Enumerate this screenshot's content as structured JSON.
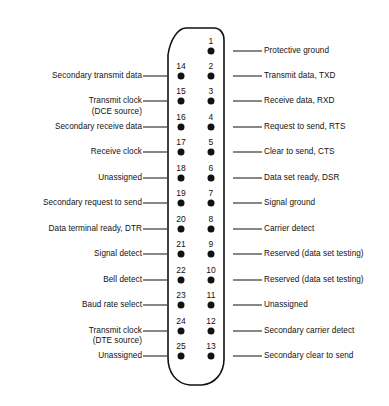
{
  "diagram": {
    "type": "db25-serial-connector-pinout",
    "connector": {
      "shape": "d-subminiature-db25",
      "outline_color": "#111111",
      "pin_color": "#111111",
      "background": "#ffffff"
    },
    "right_column": {
      "side": "right",
      "pins": [
        {
          "number": "1",
          "label": "Protective ground"
        },
        {
          "number": "2",
          "label": "Transmit data, TXD"
        },
        {
          "number": "3",
          "label": "Receive data, RXD"
        },
        {
          "number": "4",
          "label": "Request to send, RTS"
        },
        {
          "number": "5",
          "label": "Clear to send, CTS"
        },
        {
          "number": "6",
          "label": "Data set ready, DSR"
        },
        {
          "number": "7",
          "label": "Signal ground"
        },
        {
          "number": "8",
          "label": "Carrier detect"
        },
        {
          "number": "9",
          "label": "Reserved (data set testing)"
        },
        {
          "number": "10",
          "label": "Reserved (data set testing)"
        },
        {
          "number": "11",
          "label": "Unassigned"
        },
        {
          "number": "12",
          "label": "Secondary carrier detect"
        },
        {
          "number": "13",
          "label": "Secondary clear to send"
        }
      ]
    },
    "left_column": {
      "side": "left",
      "pins": [
        {
          "number": "14",
          "label": "Secondary transmit data",
          "label2": ""
        },
        {
          "number": "15",
          "label": "Transmit clock",
          "label2": "(DCE source)"
        },
        {
          "number": "16",
          "label": "Secondary receive data",
          "label2": ""
        },
        {
          "number": "17",
          "label": "Receive clock",
          "label2": ""
        },
        {
          "number": "18",
          "label": "Unassigned",
          "label2": ""
        },
        {
          "number": "19",
          "label": "Secondary request to send",
          "label2": ""
        },
        {
          "number": "20",
          "label": "Data terminal ready, DTR",
          "label2": ""
        },
        {
          "number": "21",
          "label": "Signal detect",
          "label2": ""
        },
        {
          "number": "22",
          "label": "Bell detect",
          "label2": ""
        },
        {
          "number": "23",
          "label": "Baud rate select",
          "label2": ""
        },
        {
          "number": "24",
          "label": "Transmit clock",
          "label2": "(DTE source)"
        },
        {
          "number": "25",
          "label": "Unassigned",
          "label2": ""
        }
      ]
    }
  }
}
